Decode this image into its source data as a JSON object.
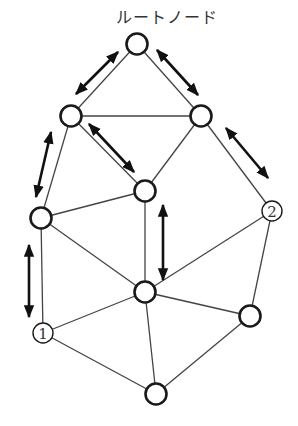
{
  "diagram": {
    "root_label": "ルートノード",
    "colors": {
      "line": "#444444",
      "node_stroke": "#1a1a1a",
      "arrow": "#111111",
      "background": "#ffffff"
    },
    "nodes": [
      {
        "id": "root",
        "x": 137,
        "y": 44,
        "label": ""
      },
      {
        "id": "a",
        "x": 71,
        "y": 116,
        "label": ""
      },
      {
        "id": "b",
        "x": 201,
        "y": 116,
        "label": ""
      },
      {
        "id": "c",
        "x": 145,
        "y": 191,
        "label": ""
      },
      {
        "id": "d",
        "x": 41,
        "y": 218,
        "label": ""
      },
      {
        "id": "n2",
        "x": 272,
        "y": 211,
        "label": "2"
      },
      {
        "id": "e",
        "x": 145,
        "y": 292,
        "label": ""
      },
      {
        "id": "n1",
        "x": 43,
        "y": 333,
        "label": "1"
      },
      {
        "id": "f",
        "x": 250,
        "y": 316,
        "label": ""
      },
      {
        "id": "g",
        "x": 156,
        "y": 394,
        "label": ""
      }
    ],
    "edges": [
      [
        "root",
        "a"
      ],
      [
        "root",
        "b"
      ],
      [
        "a",
        "b"
      ],
      [
        "a",
        "c"
      ],
      [
        "a",
        "d"
      ],
      [
        "b",
        "c"
      ],
      [
        "b",
        "n2"
      ],
      [
        "c",
        "d"
      ],
      [
        "c",
        "e"
      ],
      [
        "d",
        "e"
      ],
      [
        "d",
        "n1"
      ],
      [
        "n1",
        "e"
      ],
      [
        "n1",
        "g"
      ],
      [
        "e",
        "g"
      ],
      [
        "e",
        "f"
      ],
      [
        "e",
        "n2"
      ],
      [
        "n2",
        "f"
      ],
      [
        "f",
        "g"
      ]
    ],
    "arrows": [
      {
        "x1": 118,
        "y1": 52,
        "x2": 76,
        "y2": 94
      },
      {
        "x1": 157,
        "y1": 50,
        "x2": 198,
        "y2": 95
      },
      {
        "x1": 89,
        "y1": 124,
        "x2": 134,
        "y2": 172
      },
      {
        "x1": 51,
        "y1": 132,
        "x2": 36,
        "y2": 197
      },
      {
        "x1": 226,
        "y1": 128,
        "x2": 268,
        "y2": 178
      },
      {
        "x1": 163,
        "y1": 205,
        "x2": 163,
        "y2": 280
      },
      {
        "x1": 29,
        "y1": 245,
        "x2": 29,
        "y2": 317
      }
    ]
  }
}
